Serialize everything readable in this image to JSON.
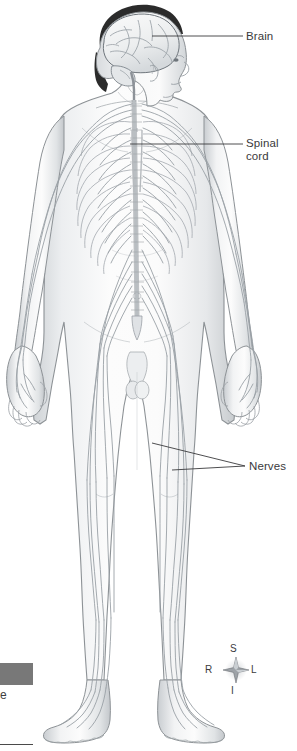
{
  "figure": {
    "view": "anterior"
  },
  "labels": [
    {
      "id": "brain",
      "text": "Brain",
      "name": "label-brain",
      "leader": {
        "x1": 152,
        "y1": 36,
        "x2": 243,
        "y2": 36
      }
    },
    {
      "id": "spinal_cord",
      "text": "Spinal\ncord",
      "name": "label-spinal-cord",
      "leader": {
        "x1": 130,
        "y1": 144,
        "x2": 243,
        "y2": 144
      }
    },
    {
      "id": "nerves",
      "text": "Nerves",
      "name": "label-nerves",
      "leaders": [
        {
          "x1": 152,
          "y1": 443,
          "x2": 245,
          "y2": 466
        },
        {
          "x1": 172,
          "y1": 470,
          "x2": 245,
          "y2": 466
        }
      ]
    }
  ],
  "compass": {
    "name": "orientation-compass",
    "superior": "S",
    "right": "R",
    "left": "L",
    "inferior": "I",
    "center": {
      "x": 236,
      "y": 670
    }
  },
  "caption": {
    "bar_color": "#787878",
    "truncated_text": "e"
  },
  "colors": {
    "outline": "#8d9296",
    "nerve": "#9aa0a6",
    "skin_light": "#fbfbfb",
    "skin_shade": "#d7dadd",
    "hair": "#2b2b2b",
    "text": "#3a3a3c",
    "caption_bar": "#787878"
  }
}
